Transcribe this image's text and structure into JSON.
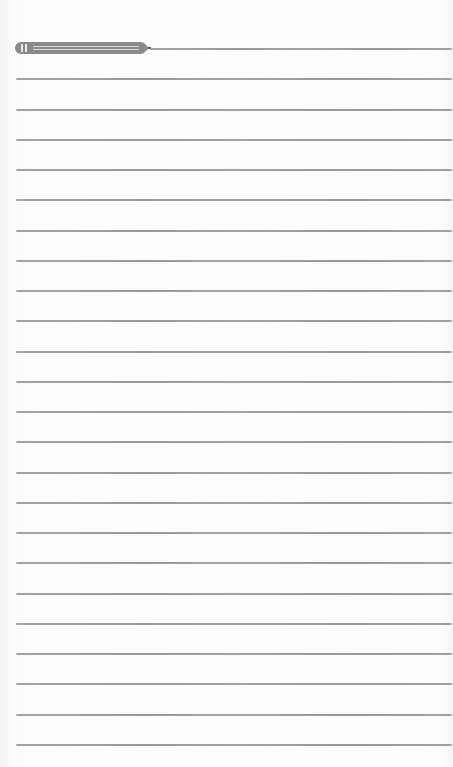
{
  "page": {
    "type": "lined-notepad",
    "line_count": 24,
    "first_line_y": 48,
    "line_spacing": 30.26,
    "line_color": "#919191",
    "background_color": "#fdfdfd"
  },
  "decoration": {
    "icon": "pencil-icon",
    "color": "#8a8a8a"
  }
}
